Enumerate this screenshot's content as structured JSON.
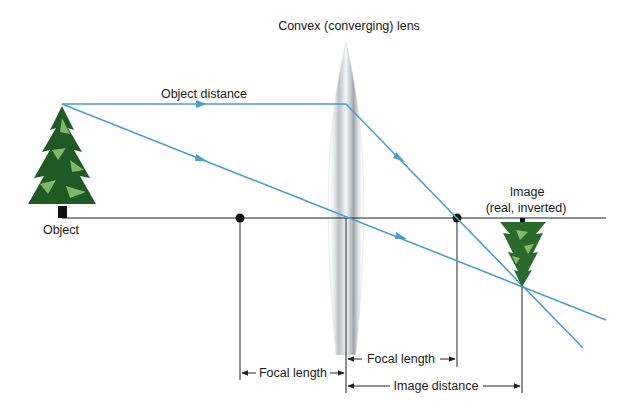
{
  "title": "Convex (converging) lens",
  "labels": {
    "object": "Object",
    "object_distance": "Object distance",
    "image_line1": "Image",
    "image_line2": "(real, inverted)",
    "focal_length_left": "Focal length",
    "focal_length_right": "Focal length",
    "image_distance": "Image distance"
  },
  "colors": {
    "ray": "#4a9fd0",
    "axis": "#222222",
    "tree_dark": "#1f5a24",
    "tree_light": "#7fb86a",
    "lens": "#c9ced1"
  },
  "elements": {
    "lens": "convex-lens",
    "object": "upright-tree",
    "image": "inverted-tree",
    "focal_points": 2,
    "rays": 2
  }
}
